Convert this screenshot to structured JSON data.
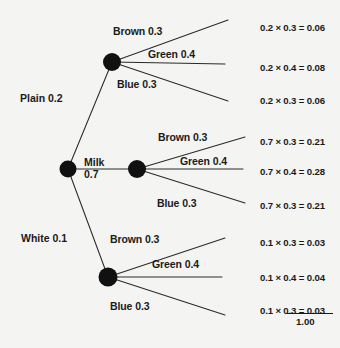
{
  "diagram": {
    "type": "probability-tree",
    "total_label": "1.00",
    "root": {
      "cx": 68,
      "cy": 169,
      "r": 8.5
    },
    "stems": [
      {
        "id": "plain",
        "label": "Plain 0.2",
        "outcome": "Plain",
        "probability": 0.2,
        "x": 20,
        "y": 92,
        "node": {
          "cx": 112,
          "cy": 62,
          "r": 9
        }
      },
      {
        "id": "milk",
        "label": "Milk\n0.7",
        "label_line1": "Milk",
        "label_line2": "0.7",
        "outcome": "Milk",
        "probability": 0.7,
        "x": 84,
        "y": 156,
        "node": {
          "cx": 137,
          "cy": 169,
          "r": 9
        }
      },
      {
        "id": "white",
        "label": "White 0.1",
        "outcome": "White",
        "probability": 0.1,
        "x": 21,
        "y": 232,
        "node": {
          "cx": 108,
          "cy": 277,
          "r": 9.5
        }
      }
    ],
    "branch_groups": [
      {
        "stem": "plain",
        "branches": [
          {
            "label": "Brown 0.3",
            "outcome": "Brown",
            "probability": 0.3,
            "lx": 113,
            "ly": 25,
            "ex": 228,
            "ey": 20,
            "result": "0.2 × 0.3 = 0.06",
            "rx": 260,
            "ry": 22,
            "value": 0.06
          },
          {
            "label": "Green 0.4",
            "outcome": "Green",
            "probability": 0.4,
            "lx": 148,
            "ly": 48,
            "ex": 225,
            "ey": 64,
            "result": "0.2 × 0.4 = 0.08",
            "rx": 260,
            "ry": 62,
            "value": 0.08
          },
          {
            "label": "Blue 0.3",
            "outcome": "Blue",
            "probability": 0.3,
            "lx": 117,
            "ly": 78,
            "ex": 228,
            "ey": 101,
            "result": "0.2 × 0.3 = 0.06",
            "rx": 260,
            "ry": 95,
            "value": 0.06
          }
        ]
      },
      {
        "stem": "milk",
        "branches": [
          {
            "label": "Brown 0.3",
            "outcome": "Brown",
            "probability": 0.3,
            "lx": 158,
            "ly": 131,
            "ex": 245,
            "ey": 137,
            "result": "0.7 × 0.3 = 0.21",
            "rx": 260,
            "ry": 136,
            "value": 0.21
          },
          {
            "label": "Green 0.4",
            "outcome": "Green",
            "probability": 0.4,
            "lx": 180,
            "ly": 155,
            "ex": 243,
            "ey": 169,
            "result": "0.7 × 0.4 = 0.28",
            "rx": 260,
            "ry": 166,
            "value": 0.28
          },
          {
            "label": "Blue 0.3",
            "outcome": "Blue",
            "probability": 0.3,
            "lx": 157,
            "ly": 197,
            "ex": 245,
            "ey": 203,
            "result": "0.7 × 0.3 = 0.21",
            "rx": 260,
            "ry": 200,
            "value": 0.21
          }
        ]
      },
      {
        "stem": "white",
        "branches": [
          {
            "label": "Brown 0.3",
            "outcome": "Brown",
            "probability": 0.3,
            "lx": 110,
            "ly": 233,
            "ex": 225,
            "ey": 238,
            "result": "0.1 × 0.3 = 0.03",
            "rx": 260,
            "ry": 237,
            "value": 0.03
          },
          {
            "label": "Green 0.4",
            "outcome": "Green",
            "probability": 0.4,
            "lx": 152,
            "ly": 258,
            "ex": 222,
            "ey": 277,
            "result": "0.1 × 0.4 = 0.04",
            "rx": 260,
            "ry": 272,
            "value": 0.04
          },
          {
            "label": "Blue 0.3",
            "outcome": "Blue",
            "probability": 0.3,
            "lx": 110,
            "ly": 300,
            "ex": 225,
            "ey": 315,
            "result": "0.1 × 0.3 = 0.03",
            "rx": 260,
            "ry": 305,
            "value": 0.03
          }
        ]
      }
    ]
  },
  "chart_data": {
    "type": "tree",
    "level1": {
      "labels": [
        "Plain",
        "Milk",
        "White"
      ],
      "values": [
        0.2,
        0.7,
        0.1
      ]
    },
    "level2": {
      "labels": [
        "Brown",
        "Green",
        "Blue"
      ],
      "values": [
        0.3,
        0.4,
        0.3
      ]
    },
    "outcomes": [
      {
        "path": "Plain-Brown",
        "expression": "0.2 × 0.3 = 0.06",
        "value": 0.06
      },
      {
        "path": "Plain-Green",
        "expression": "0.2 × 0.4 = 0.08",
        "value": 0.08
      },
      {
        "path": "Plain-Blue",
        "expression": "0.2 × 0.3 = 0.06",
        "value": 0.06
      },
      {
        "path": "Milk-Brown",
        "expression": "0.7 × 0.3 = 0.21",
        "value": 0.21
      },
      {
        "path": "Milk-Green",
        "expression": "0.7 × 0.4 = 0.28",
        "value": 0.28
      },
      {
        "path": "Milk-Blue",
        "expression": "0.7 × 0.3 = 0.21",
        "value": 0.21
      },
      {
        "path": "White-Brown",
        "expression": "0.1 × 0.3 = 0.03",
        "value": 0.03
      },
      {
        "path": "White-Green",
        "expression": "0.1 × 0.4 = 0.04",
        "value": 0.04
      },
      {
        "path": "White-Blue",
        "expression": "0.1 × 0.3 = 0.03",
        "value": 0.03
      }
    ],
    "total": "1.00"
  }
}
